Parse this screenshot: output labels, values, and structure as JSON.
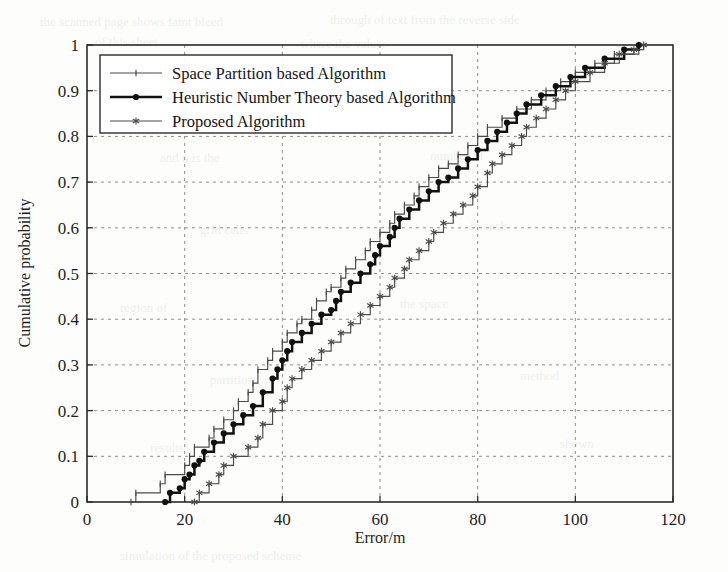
{
  "figure": {
    "background_color": "#fdfdfc",
    "axis_color": "#2b2b2b",
    "grid_color": "#8d8d8d"
  },
  "axes": {
    "x_label": "Error/m",
    "y_label": "Cumulative probability",
    "x_ticks": [
      "0",
      "20",
      "40",
      "60",
      "80",
      "100",
      "120"
    ],
    "y_ticks": [
      "0",
      "0.1",
      "0.2",
      "0.3",
      "0.4",
      "0.5",
      "0.6",
      "0.7",
      "0.8",
      "0.9",
      "1"
    ]
  },
  "legend": {
    "position": "top-left-inside",
    "entries": [
      {
        "label": "Space Partition based  Algorithm",
        "color": "#4a4a4a",
        "style": "thin-tick"
      },
      {
        "label": "Heuristic Number Theory based Algorithm",
        "color": "#111111",
        "style": "bold-dot"
      },
      {
        "label": "Proposed Algorithm",
        "color": "#4a4a4a",
        "style": "thin-star"
      }
    ]
  },
  "chart_data": {
    "type": "line",
    "title": "",
    "xlabel": "Error/m",
    "ylabel": "Cumulative probability",
    "xlim": [
      0,
      120
    ],
    "ylim": [
      0,
      1
    ],
    "grid": true,
    "legend_position": "upper left",
    "note": "Empirical CDF (staircase) of positioning error for three algorithms",
    "series": [
      {
        "name": "Space Partition based  Algorithm",
        "color": "#4a4a4a",
        "linewidth": "thin",
        "marker": "tick",
        "x": [
          9,
          10,
          15,
          16,
          20,
          21,
          22,
          25,
          26,
          28,
          30,
          31,
          33,
          34,
          35,
          37,
          38,
          40,
          41,
          43,
          44,
          46,
          47,
          49,
          50,
          52,
          53,
          55,
          57,
          58,
          60,
          62,
          63,
          65,
          67,
          68,
          70,
          72,
          74,
          76,
          78,
          80,
          82,
          85,
          88,
          91,
          94,
          97,
          100,
          104,
          108,
          113
        ],
        "y": [
          0.0,
          0.02,
          0.04,
          0.06,
          0.08,
          0.1,
          0.12,
          0.14,
          0.16,
          0.18,
          0.2,
          0.22,
          0.24,
          0.26,
          0.29,
          0.31,
          0.33,
          0.35,
          0.37,
          0.39,
          0.4,
          0.42,
          0.44,
          0.46,
          0.47,
          0.49,
          0.51,
          0.53,
          0.55,
          0.57,
          0.59,
          0.61,
          0.63,
          0.65,
          0.67,
          0.69,
          0.71,
          0.73,
          0.74,
          0.76,
          0.78,
          0.8,
          0.82,
          0.84,
          0.86,
          0.88,
          0.9,
          0.92,
          0.94,
          0.96,
          0.98,
          1.0
        ]
      },
      {
        "name": "Heuristic Number Theory based Algorithm",
        "color": "#111111",
        "linewidth": "bold",
        "marker": "dot",
        "x": [
          16,
          17,
          19,
          20,
          21,
          22,
          23,
          24,
          26,
          28,
          30,
          32,
          34,
          36,
          38,
          39,
          40,
          41,
          42,
          44,
          46,
          48,
          50,
          51,
          52,
          54,
          56,
          58,
          59,
          60,
          62,
          63,
          64,
          66,
          68,
          70,
          72,
          74,
          76,
          78,
          80,
          82,
          84,
          86,
          88,
          90,
          93,
          96,
          99,
          102,
          106,
          110,
          113
        ],
        "y": [
          0.0,
          0.02,
          0.03,
          0.05,
          0.06,
          0.08,
          0.09,
          0.11,
          0.13,
          0.15,
          0.17,
          0.19,
          0.21,
          0.24,
          0.27,
          0.29,
          0.31,
          0.33,
          0.35,
          0.37,
          0.39,
          0.41,
          0.42,
          0.44,
          0.46,
          0.48,
          0.5,
          0.52,
          0.54,
          0.56,
          0.58,
          0.6,
          0.62,
          0.64,
          0.66,
          0.68,
          0.7,
          0.71,
          0.73,
          0.75,
          0.77,
          0.79,
          0.81,
          0.83,
          0.85,
          0.87,
          0.89,
          0.91,
          0.93,
          0.95,
          0.97,
          0.99,
          1.0
        ]
      },
      {
        "name": "Proposed Algorithm",
        "color": "#4a4a4a",
        "linewidth": "thin",
        "marker": "star",
        "x": [
          22,
          23,
          25,
          27,
          28,
          30,
          33,
          35,
          36,
          38,
          40,
          41,
          42,
          44,
          46,
          48,
          50,
          52,
          54,
          56,
          58,
          60,
          62,
          63,
          65,
          66,
          68,
          70,
          71,
          73,
          75,
          77,
          79,
          80,
          82,
          83,
          85,
          87,
          89,
          90,
          92,
          94,
          96,
          98,
          100,
          103,
          106,
          109,
          112,
          114
        ],
        "y": [
          0.0,
          0.02,
          0.04,
          0.06,
          0.08,
          0.1,
          0.12,
          0.14,
          0.17,
          0.2,
          0.22,
          0.25,
          0.27,
          0.29,
          0.31,
          0.33,
          0.35,
          0.37,
          0.39,
          0.41,
          0.43,
          0.45,
          0.47,
          0.49,
          0.51,
          0.53,
          0.55,
          0.57,
          0.59,
          0.61,
          0.63,
          0.65,
          0.67,
          0.69,
          0.72,
          0.74,
          0.76,
          0.78,
          0.8,
          0.82,
          0.84,
          0.86,
          0.88,
          0.9,
          0.92,
          0.94,
          0.96,
          0.98,
          0.99,
          1.0
        ]
      }
    ]
  },
  "ghost_text": [
    {
      "t": "the  scanned  page  shows  faint  bleed",
      "x": 40,
      "y": 14,
      "s": 13
    },
    {
      "t": "through  of  text  from  the  reverse  side",
      "x": 330,
      "y": 12,
      "s": 13
    },
    {
      "t": "of  this  sheet",
      "x": 95,
      "y": 34,
      "s": 13
    },
    {
      "t": "where  the  values",
      "x": 300,
      "y": 36,
      "s": 13
    },
    {
      "t": "and  n  is  the",
      "x": 160,
      "y": 150,
      "s": 13
    },
    {
      "t": "number  of",
      "x": 430,
      "y": 148,
      "s": 13
    },
    {
      "t": "grid  cells",
      "x": 200,
      "y": 222,
      "s": 13
    },
    {
      "t": "in  each",
      "x": 470,
      "y": 218,
      "s": 13
    },
    {
      "t": "region  of",
      "x": 120,
      "y": 300,
      "s": 13
    },
    {
      "t": "the  space",
      "x": 400,
      "y": 296,
      "s": 13
    },
    {
      "t": "partition",
      "x": 210,
      "y": 372,
      "s": 13
    },
    {
      "t": "method",
      "x": 520,
      "y": 368,
      "s": 13
    },
    {
      "t": "results",
      "x": 150,
      "y": 440,
      "s": 13
    },
    {
      "t": "shown",
      "x": 560,
      "y": 436,
      "s": 13
    },
    {
      "t": "simulation  of  the  proposed  scheme",
      "x": 120,
      "y": 548,
      "s": 13
    }
  ]
}
